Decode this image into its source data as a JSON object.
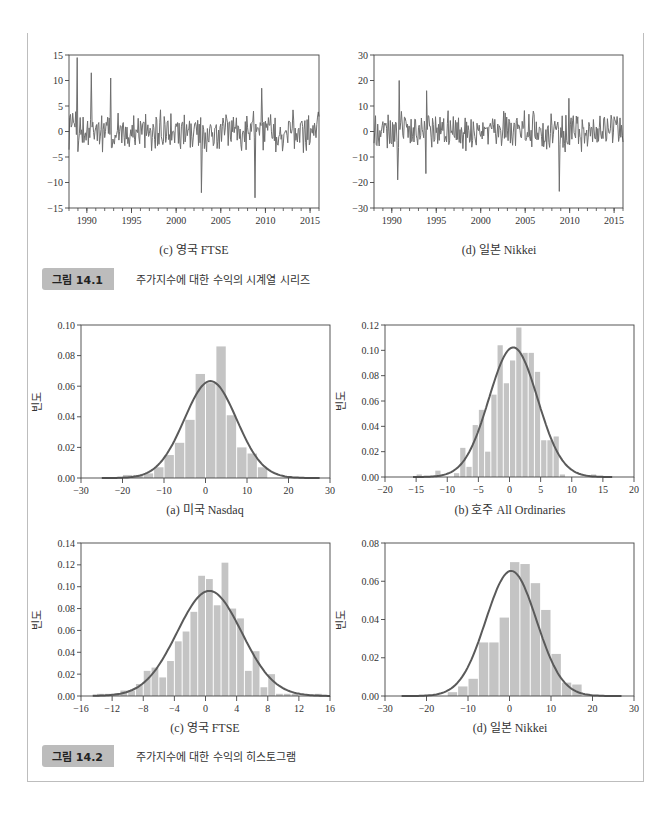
{
  "figures": {
    "fig_14_1": {
      "label": "그림 14.1",
      "caption": "주가지수에 대한 수익의 시계열 시리즈",
      "subcaptions": [
        "(c) 영국 FTSE",
        "(d) 일본 Nikkei"
      ]
    },
    "fig_14_2": {
      "label": "그림 14.2",
      "caption": "주가지수에 대한 수익의 히스토그램",
      "subcaptions": [
        "(a) 미국 Nasdaq",
        "(b) 호주 All Ordinaries",
        "(c) 영국 FTSE",
        "(d) 일본 Nikkei"
      ]
    }
  },
  "colors": {
    "line": "#6e6e6e",
    "bar": "#c4c4c4",
    "curve": "#5a5a5a",
    "axis": "#444444"
  },
  "chart_data": [
    {
      "id": "ts_ftse",
      "type": "line",
      "title": "(c) 영국 FTSE",
      "xlabel": "",
      "ylabel": "",
      "xlim": [
        1988,
        2016
      ],
      "ylim": [
        -15,
        15
      ],
      "xticks": [
        1990,
        1995,
        2000,
        2005,
        2010,
        2015
      ],
      "yticks": [
        -15,
        -10,
        -5,
        0,
        5,
        10,
        15
      ],
      "peaks": [
        [
          1988.9,
          14.5
        ],
        [
          1990.5,
          11.5
        ],
        [
          1992.7,
          10.5
        ],
        [
          2002.8,
          -12
        ],
        [
          2008.8,
          -13
        ],
        [
          2009.6,
          8.5
        ]
      ],
      "grid": false
    },
    {
      "id": "ts_nikkei",
      "type": "line",
      "title": "(d) 일본 Nikkei",
      "xlabel": "",
      "ylabel": "",
      "xlim": [
        1988,
        2016
      ],
      "ylim": [
        -30,
        30
      ],
      "xticks": [
        1990,
        1995,
        2000,
        2005,
        2010,
        2015
      ],
      "yticks": [
        -30,
        -20,
        -10,
        0,
        10,
        20,
        30
      ],
      "peaks": [
        [
          1990.8,
          20
        ],
        [
          1990.7,
          -19
        ],
        [
          1993.9,
          16
        ],
        [
          1993.8,
          -16.5
        ],
        [
          2008.8,
          -23.5
        ],
        [
          2009.9,
          13
        ]
      ],
      "grid": false
    },
    {
      "id": "hist_nasdaq",
      "type": "bar",
      "title": "(a) 미국 Nasdaq",
      "xlabel": "",
      "ylabel": "빈도",
      "xlim": [
        -30,
        30
      ],
      "ylim": [
        0,
        0.1
      ],
      "xticks": [
        -30,
        -20,
        -10,
        0,
        10,
        20,
        30
      ],
      "yticks": [
        0.0,
        0.02,
        0.04,
        0.06,
        0.08,
        0.1
      ],
      "bin_start": -20,
      "bin_width": 2.5,
      "values": [
        0.002,
        0.002,
        0.003,
        0.007,
        0.015,
        0.023,
        0.038,
        0.068,
        0.062,
        0.086,
        0.041,
        0.02,
        0.016,
        0.007
      ],
      "normal_fit": {
        "mean": 1.2,
        "sd": 6.3,
        "range": [
          -25,
          27.5
        ]
      },
      "grid": false
    },
    {
      "id": "hist_allords",
      "type": "bar",
      "title": "(b) 호주 All Ordinaries",
      "xlabel": "",
      "ylabel": "빈도",
      "xlim": [
        -20,
        20
      ],
      "ylim": [
        0,
        0.12
      ],
      "xticks": [
        -20,
        -15,
        -10,
        -5,
        0,
        5,
        10,
        15,
        20
      ],
      "yticks": [
        0.0,
        0.02,
        0.04,
        0.06,
        0.08,
        0.1,
        0.12
      ],
      "bin_start": -15,
      "bin_width": 1,
      "values": [
        0.002,
        0,
        0,
        0.005,
        0,
        0,
        0.003,
        0.023,
        0.008,
        0.041,
        0.053,
        0.02,
        0.065,
        0.104,
        0.074,
        0.092,
        0.118,
        0.098,
        0.098,
        0.083,
        0.029,
        0.029,
        0.032,
        0.002,
        0,
        0,
        0,
        0,
        0.002
      ],
      "normal_fit": {
        "mean": 0.6,
        "sd": 3.9,
        "range": [
          -15.5,
          16.5
        ]
      },
      "grid": false
    },
    {
      "id": "hist_ftse",
      "type": "bar",
      "title": "(c) 영국 FTSE",
      "xlabel": "",
      "ylabel": "빈도",
      "xlim": [
        -16,
        16
      ],
      "ylim": [
        0,
        0.14
      ],
      "xticks": [
        -16,
        -12,
        -8,
        -4,
        0,
        4,
        8,
        12,
        16
      ],
      "yticks": [
        0.0,
        0.02,
        0.04,
        0.06,
        0.08,
        0.1,
        0.12,
        0.14
      ],
      "bin_start": -14,
      "bin_width": 1,
      "values": [
        0.002,
        0.002,
        0.002,
        0.005,
        0.005,
        0.011,
        0.023,
        0.026,
        0.017,
        0.032,
        0.05,
        0.059,
        0.077,
        0.11,
        0.107,
        0.083,
        0.122,
        0.08,
        0.071,
        0.023,
        0.041,
        0.008,
        0.02,
        0.002,
        0.002,
        0.002,
        0,
        0,
        0.002
      ],
      "normal_fit": {
        "mean": 0.5,
        "sd": 4.15,
        "range": [
          -14.5,
          16
        ]
      },
      "grid": false
    },
    {
      "id": "hist_nikkei",
      "type": "bar",
      "title": "(d) 일본 Nikkei",
      "xlabel": "",
      "ylabel": "빈도",
      "xlim": [
        -30,
        30
      ],
      "ylim": [
        0,
        0.08
      ],
      "xticks": [
        -30,
        -20,
        -10,
        0,
        10,
        20,
        30
      ],
      "yticks": [
        0.0,
        0.02,
        0.04,
        0.06,
        0.08
      ],
      "bin_start": -15,
      "bin_width": 2.5,
      "values": [
        0.002,
        0.005,
        0.009,
        0.028,
        0.028,
        0.041,
        0.07,
        0.069,
        0.059,
        0.045,
        0.022,
        0.007,
        0.006
      ],
      "normal_fit": {
        "mean": 0.4,
        "sd": 6.1,
        "range": [
          -26,
          27
        ]
      },
      "grid": false
    }
  ]
}
